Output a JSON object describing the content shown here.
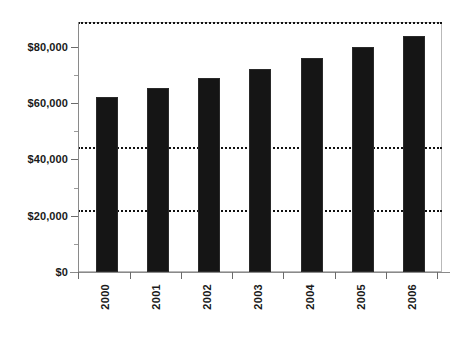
{
  "chart_data": {
    "type": "bar",
    "title": "",
    "subtitle": "",
    "xlabel": "",
    "ylabel": "",
    "categories": [
      "2000",
      "2001",
      "2002",
      "2003",
      "2004",
      "2005",
      "2006"
    ],
    "values": [
      56000,
      59000,
      62000,
      65000,
      68500,
      72000,
      75500
    ],
    "series": [
      {
        "name": "",
        "values": [
          56000,
          59000,
          62000,
          65000,
          68500,
          72000,
          75500
        ]
      }
    ],
    "ylim": [
      0,
      80000
    ],
    "ytick_values": [
      0,
      20000,
      40000,
      60000,
      80000
    ],
    "ytick_labels": [
      "$0",
      "$20,000",
      "$40,000",
      "$60,000",
      "$80,000"
    ],
    "yminor_tick_values": [
      10000,
      30000,
      50000,
      70000
    ],
    "gridlines": {
      "horizontal_at": [
        20000,
        40000,
        80000
      ],
      "style": "dotted",
      "color": "#111111",
      "vertical": false
    },
    "legend": {
      "visible": false,
      "entries": []
    },
    "annotations": [],
    "colors": {
      "bar": "#151515",
      "grid": "#111111",
      "frame": "#b9b9b9",
      "axis": "#8a8a8a",
      "text": "#1a1a1a",
      "background": "#ffffff"
    },
    "xtick_label_rotation": 90
  }
}
